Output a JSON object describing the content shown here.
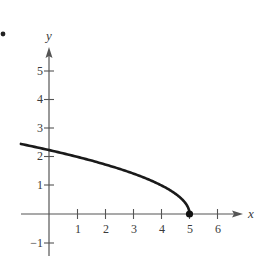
{
  "chart_data": {
    "type": "line",
    "title": "",
    "xlabel": "x",
    "ylabel": "y",
    "xlim": [
      -1,
      6.6
    ],
    "ylim": [
      -1.3,
      5.8
    ],
    "grid": false,
    "x_ticks": [
      1,
      2,
      3,
      4,
      5,
      6
    ],
    "x_tick_labels": [
      "1",
      "2",
      "3",
      "4",
      "5",
      "6"
    ],
    "y_ticks": [
      -1,
      1,
      2,
      3,
      4,
      5
    ],
    "y_tick_labels": [
      "−1",
      "1",
      "2",
      "3",
      "4",
      "5"
    ],
    "series": [
      {
        "name": "y = sqrt(5 - x)",
        "x": [
          -1,
          0,
          1,
          2,
          3,
          4,
          4.5,
          4.8,
          5
        ],
        "y": [
          2.449,
          2.236,
          2.0,
          1.732,
          1.414,
          1.0,
          0.707,
          0.447,
          0
        ],
        "color": "#1a1a1a"
      }
    ],
    "annotations": [
      {
        "type": "endpoint",
        "x": 5,
        "y": 0,
        "style": "filled-dot"
      }
    ]
  },
  "figure": {
    "bullet": "•"
  }
}
